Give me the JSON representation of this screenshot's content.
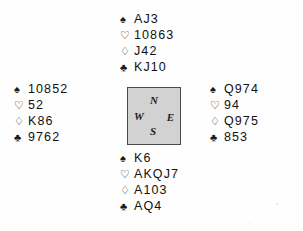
{
  "diagram": {
    "suit_symbols": {
      "spade": "♠",
      "heart": "♡",
      "diamond": "♢",
      "club": "♣"
    },
    "suit_order": [
      "spade",
      "heart",
      "diamond",
      "club"
    ],
    "compass": {
      "north": "N",
      "east": "E",
      "south": "S",
      "west": "W",
      "box_fill": "#d2d2d2",
      "box_border": "#4a4a4a"
    },
    "hands": {
      "north": {
        "position_label": "North",
        "spades": "AJ3",
        "hearts": "10863",
        "diamonds": "J42",
        "clubs": "KJ10"
      },
      "west": {
        "position_label": "West",
        "spades": "10852",
        "hearts": "52",
        "diamonds": "K86",
        "clubs": "9762"
      },
      "east": {
        "position_label": "East",
        "spades": "Q974",
        "hearts": "94",
        "diamonds": "Q975",
        "clubs": "853"
      },
      "south": {
        "position_label": "South",
        "spades": "K6",
        "hearts": "AKQJ7",
        "diamonds": "A103",
        "clubs": "AQ4"
      }
    }
  }
}
